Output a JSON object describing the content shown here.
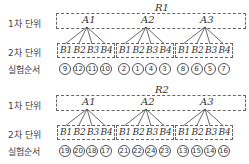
{
  "labels": {
    "level1": "1차 단위",
    "level2": "2차 단위",
    "order": "실험순서"
  },
  "blocks": [
    {
      "R": "R1",
      "A": [
        "A1",
        "A2",
        "A3"
      ],
      "B": [
        "B1",
        "B2",
        "B3",
        "B4"
      ],
      "order": [
        [
          "9",
          "12",
          "11",
          "10"
        ],
        [
          "2",
          "1",
          "4",
          "3"
        ],
        [
          "8",
          "6",
          "5",
          "7"
        ]
      ]
    },
    {
      "R": "R2",
      "A": [
        "A1",
        "A2",
        "A3"
      ],
      "B": [
        "B1",
        "B2",
        "B3",
        "B4"
      ],
      "order": [
        [
          "19",
          "20",
          "18",
          "17"
        ],
        [
          "21",
          "22",
          "24",
          "23"
        ],
        [
          "13",
          "15",
          "14",
          "16"
        ]
      ]
    }
  ]
}
